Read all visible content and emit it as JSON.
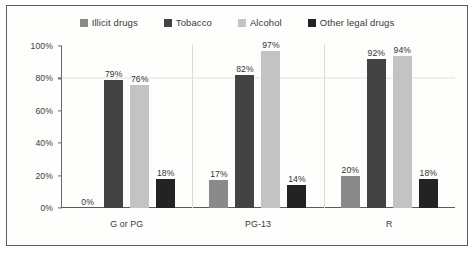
{
  "chart_data": {
    "type": "bar",
    "title": "",
    "subtitle": "",
    "xlabel": "",
    "ylabel": "",
    "ylim": [
      0,
      100
    ],
    "yticks": [
      "0%",
      "20%",
      "40%",
      "60%",
      "80%",
      "100%"
    ],
    "ytick_values": [
      0,
      20,
      40,
      60,
      80,
      100
    ],
    "grid": "horizontal-faint-at-80",
    "legend_position": "top-center",
    "categories": [
      "G or PG",
      "PG-13",
      "R"
    ],
    "series": [
      {
        "name": "Illicit drugs",
        "color": "#8a8a8a",
        "values": [
          0,
          17,
          20
        ],
        "labels": [
          "0%",
          "17%",
          "20%"
        ]
      },
      {
        "name": "Tobacco",
        "color": "#434343",
        "values": [
          79,
          82,
          92
        ],
        "labels": [
          "79%",
          "82%",
          "92%"
        ]
      },
      {
        "name": "Alcohol",
        "color": "#c3c3c3",
        "values": [
          76,
          97,
          94
        ],
        "labels": [
          "76%",
          "97%",
          "94%"
        ]
      },
      {
        "name": "Other legal drugs",
        "color": "#232323",
        "values": [
          18,
          14,
          18
        ],
        "labels": [
          "18%",
          "14%",
          "18%"
        ]
      }
    ]
  },
  "frame": {
    "border_color": "#5d5d5d",
    "background": "#fdfdfc"
  }
}
